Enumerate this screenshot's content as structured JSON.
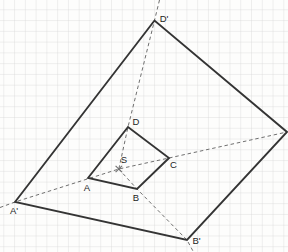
{
  "diagram": {
    "width": 288,
    "height": 252,
    "background": "#fdfdfc",
    "grid": {
      "spacing": 10.77,
      "offset_x": 3.3,
      "offset_y": 9.3,
      "line_color": "#d7d7d7",
      "line_width": 0.8
    },
    "style": {
      "solid_color": "#343434",
      "solid_width": 1.9,
      "dashed_color": "#6f6f6f",
      "dashed_width": 1,
      "dash_pattern": "3.5 2.8",
      "label_color": "#1c1c1c",
      "label_font_size": 9.5
    },
    "points": [
      {
        "id": "A",
        "x": 88,
        "y": 178,
        "label": "A",
        "lx": 87,
        "ly": 190.5
      },
      {
        "id": "B",
        "x": 137,
        "y": 189,
        "label": "B",
        "lx": 136,
        "ly": 200.5
      },
      {
        "id": "C",
        "x": 169,
        "y": 158,
        "label": "C",
        "lx": 173.5,
        "ly": 168
      },
      {
        "id": "D",
        "x": 128,
        "y": 127,
        "label": "D",
        "lx": 136,
        "ly": 124.5
      },
      {
        "id": "S",
        "x": 118.8,
        "y": 169,
        "label": "S",
        "lx": 124,
        "ly": 162.5
      },
      {
        "id": "A1",
        "x": 15,
        "y": 202,
        "label": "A'",
        "lx": 14,
        "ly": 214
      },
      {
        "id": "B1",
        "x": 187,
        "y": 240,
        "label": "B'",
        "lx": 196.5,
        "ly": 244
      },
      {
        "id": "C1",
        "x": 287,
        "y": 132,
        "label": "",
        "lx": 0,
        "ly": 0
      },
      {
        "id": "D1",
        "x": 154.5,
        "y": 20.5,
        "label": "D'",
        "lx": 164,
        "ly": 21.5
      }
    ],
    "solid_polygons": [
      {
        "name": "quad-abcd",
        "vertices": [
          "A",
          "D",
          "C",
          "B"
        ]
      },
      {
        "name": "quad-a1b1c1d1-image",
        "vertices": [
          "A1",
          "D1",
          "C1",
          "B1"
        ]
      }
    ],
    "dashed_polylines": [
      {
        "name": "dilation-ray-through-A-C",
        "points": [
          [
            0,
            207.5
          ],
          [
            15,
            202
          ],
          [
            118.8,
            169
          ],
          [
            169,
            158
          ],
          [
            287,
            132
          ]
        ]
      },
      {
        "name": "dilation-ray-through-D",
        "points": [
          [
            159.5,
            0
          ],
          [
            154.5,
            20.5
          ],
          [
            128,
            127
          ],
          [
            118.8,
            169
          ]
        ]
      },
      {
        "name": "dilation-ray-through-B",
        "points": [
          [
            118.8,
            169
          ],
          [
            137,
            189
          ],
          [
            187,
            240
          ],
          [
            193.5,
            252
          ]
        ]
      }
    ],
    "center_marker": {
      "point": "S",
      "size": 3.2
    }
  }
}
